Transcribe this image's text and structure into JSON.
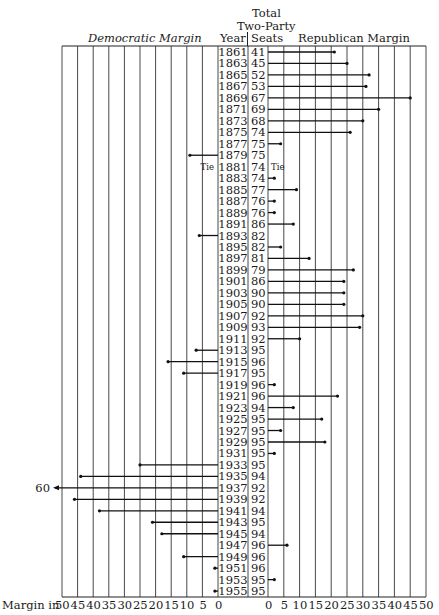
{
  "header": {
    "total_line1": "Total",
    "total_line2": "Two-Party",
    "democratic": "Democratic Margin",
    "year": "Year",
    "seats": "Seats",
    "republican": "Republican Margin"
  },
  "footer": {
    "margin_in": "Margin in",
    "left_ticks": [
      "50",
      "45",
      "40",
      "35",
      "30",
      "25",
      "20",
      "15",
      "10",
      "5",
      "0"
    ],
    "right_ticks": [
      "0",
      "5",
      "10",
      "15",
      "20",
      "25",
      "30",
      "35",
      "40",
      "45",
      "50"
    ]
  },
  "annotations": {
    "overflow_label": "60",
    "tie_label": "Tie"
  },
  "chart_data": {
    "type": "bar",
    "xlabel": "Margin in seats",
    "columns": [
      "Year",
      "Total Two-Party Seats"
    ],
    "left_series": "Democratic Margin",
    "right_series": "Republican Margin",
    "xlim": [
      0,
      50
    ],
    "grid": true,
    "rows": [
      {
        "year": "1861",
        "seats": "41",
        "party": "R",
        "margin": 21
      },
      {
        "year": "1863",
        "seats": "45",
        "party": "R",
        "margin": 25
      },
      {
        "year": "1865",
        "seats": "52",
        "party": "R",
        "margin": 32
      },
      {
        "year": "1867",
        "seats": "53",
        "party": "R",
        "margin": 31
      },
      {
        "year": "1869",
        "seats": "67",
        "party": "R",
        "margin": 45
      },
      {
        "year": "1871",
        "seats": "69",
        "party": "R",
        "margin": 35
      },
      {
        "year": "1873",
        "seats": "68",
        "party": "R",
        "margin": 30
      },
      {
        "year": "1875",
        "seats": "74",
        "party": "R",
        "margin": 26
      },
      {
        "year": "1877",
        "seats": "75",
        "party": "R",
        "margin": 4
      },
      {
        "year": "1879",
        "seats": "75",
        "party": "D",
        "margin": 9
      },
      {
        "year": "1881",
        "seats": "74",
        "party": "Tie",
        "margin": 0
      },
      {
        "year": "1883",
        "seats": "74",
        "party": "R",
        "margin": 2
      },
      {
        "year": "1885",
        "seats": "77",
        "party": "R",
        "margin": 9
      },
      {
        "year": "1887",
        "seats": "76",
        "party": "R",
        "margin": 2
      },
      {
        "year": "1889",
        "seats": "76",
        "party": "R",
        "margin": 2
      },
      {
        "year": "1891",
        "seats": "86",
        "party": "R",
        "margin": 8
      },
      {
        "year": "1893",
        "seats": "82",
        "party": "D",
        "margin": 6
      },
      {
        "year": "1895",
        "seats": "82",
        "party": "R",
        "margin": 4
      },
      {
        "year": "1897",
        "seats": "81",
        "party": "R",
        "margin": 13
      },
      {
        "year": "1899",
        "seats": "79",
        "party": "R",
        "margin": 27
      },
      {
        "year": "1901",
        "seats": "86",
        "party": "R",
        "margin": 24
      },
      {
        "year": "1903",
        "seats": "90",
        "party": "R",
        "margin": 24
      },
      {
        "year": "1905",
        "seats": "90",
        "party": "R",
        "margin": 24
      },
      {
        "year": "1907",
        "seats": "92",
        "party": "R",
        "margin": 30
      },
      {
        "year": "1909",
        "seats": "93",
        "party": "R",
        "margin": 29
      },
      {
        "year": "1911",
        "seats": "92",
        "party": "R",
        "margin": 10
      },
      {
        "year": "1913",
        "seats": "95",
        "party": "D",
        "margin": 7
      },
      {
        "year": "1915",
        "seats": "96",
        "party": "D",
        "margin": 16
      },
      {
        "year": "1917",
        "seats": "95",
        "party": "D",
        "margin": 11
      },
      {
        "year": "1919",
        "seats": "96",
        "party": "R",
        "margin": 2
      },
      {
        "year": "1921",
        "seats": "96",
        "party": "R",
        "margin": 22
      },
      {
        "year": "1923",
        "seats": "94",
        "party": "R",
        "margin": 8
      },
      {
        "year": "1925",
        "seats": "95",
        "party": "R",
        "margin": 17
      },
      {
        "year": "1927",
        "seats": "95",
        "party": "R",
        "margin": 4
      },
      {
        "year": "1929",
        "seats": "95",
        "party": "R",
        "margin": 18
      },
      {
        "year": "1931",
        "seats": "95",
        "party": "R",
        "margin": 2
      },
      {
        "year": "1933",
        "seats": "95",
        "party": "D",
        "margin": 25
      },
      {
        "year": "1935",
        "seats": "94",
        "party": "D",
        "margin": 44
      },
      {
        "year": "1937",
        "seats": "92",
        "party": "D",
        "margin": 60
      },
      {
        "year": "1939",
        "seats": "92",
        "party": "D",
        "margin": 46
      },
      {
        "year": "1941",
        "seats": "94",
        "party": "D",
        "margin": 38
      },
      {
        "year": "1943",
        "seats": "95",
        "party": "D",
        "margin": 21
      },
      {
        "year": "1945",
        "seats": "94",
        "party": "D",
        "margin": 18
      },
      {
        "year": "1947",
        "seats": "96",
        "party": "R",
        "margin": 6
      },
      {
        "year": "1949",
        "seats": "96",
        "party": "D",
        "margin": 11
      },
      {
        "year": "1951",
        "seats": "96",
        "party": "D",
        "margin": 1
      },
      {
        "year": "1953",
        "seats": "95",
        "party": "R",
        "margin": 2
      },
      {
        "year": "1955",
        "seats": "95",
        "party": "D",
        "margin": 1
      }
    ]
  }
}
